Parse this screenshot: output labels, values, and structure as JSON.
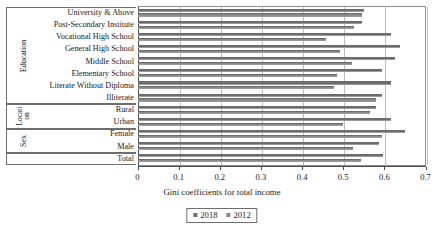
{
  "chart_data": {
    "type": "bar",
    "orientation": "horizontal",
    "title": "",
    "xlabel": "Gini coefficients for total income",
    "ylabel": "",
    "xlim": [
      0,
      0.7
    ],
    "xticks": [
      "0",
      "0.1",
      "0.2",
      "0.3",
      "0.4",
      "0.5",
      "0.6",
      "0.7"
    ],
    "grid": true,
    "legend_position": "bottom",
    "categories": [
      "University & Above",
      "Post-Secondary Institute",
      "Vocational High School",
      "General High School",
      "Middle School",
      "Elementary School",
      "Literate Without Diploma",
      "Illiterate",
      "Rural",
      "Urban",
      "Female",
      "Male",
      "Total"
    ],
    "series": [
      {
        "name": "2018",
        "color": "#6e6e6e",
        "values": [
          0.55,
          0.546,
          0.617,
          0.637,
          0.625,
          0.594,
          0.617,
          0.594,
          0.58,
          0.615,
          0.65,
          0.587,
          0.597
        ]
      },
      {
        "name": "2012",
        "color": "#8a8a8a",
        "values": [
          0.546,
          0.526,
          0.458,
          0.492,
          0.521,
          0.485,
          0.478,
          0.58,
          0.565,
          0.5,
          0.594,
          0.524,
          0.543
        ]
      }
    ],
    "groups": [
      {
        "label": "Education",
        "rows": 8,
        "wrap": false
      },
      {
        "label": "Locati on",
        "rows": 2,
        "wrap": true
      },
      {
        "label": "Sex",
        "rows": 2,
        "wrap": false
      },
      {
        "label": "",
        "rows": 1,
        "wrap": false
      }
    ]
  },
  "legend": {
    "items": [
      {
        "label": "2018"
      },
      {
        "label": "2012"
      }
    ]
  }
}
